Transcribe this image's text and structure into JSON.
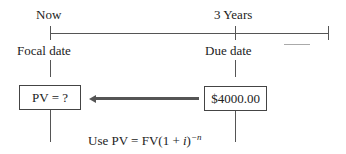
{
  "timeline": {
    "start_label": "Now",
    "mid_label": "3 Years",
    "start_sublabel": "Focal date",
    "mid_sublabel": "Due date"
  },
  "boxes": {
    "left": "PV = ?",
    "right": "$4000.00"
  },
  "formula": {
    "prefix": "Use PV = FV(1 + ",
    "i": "i",
    "close": ")",
    "exponent": "−n"
  }
}
